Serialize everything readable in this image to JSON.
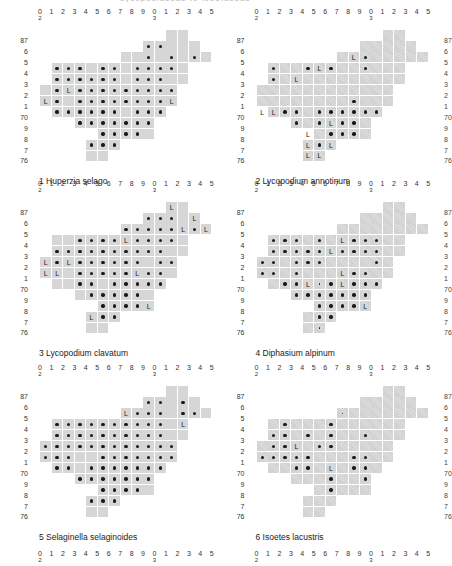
{
  "page": {
    "top_cut_text": "Lycopodiaceae to Isoetaceae"
  },
  "axis": {
    "x_labels": [
      "0",
      "1",
      "2",
      "3",
      "4",
      "5",
      "6",
      "7",
      "8",
      "9",
      "0",
      "1",
      "2",
      "3",
      "4",
      "5"
    ],
    "x_sub_labels": {
      "0": "2",
      "10": "3"
    },
    "y_labels": [
      "87",
      "6",
      "5",
      "4",
      "3",
      "2",
      "1",
      "70",
      "9",
      "8",
      "7",
      "76"
    ]
  },
  "shared_shape": {
    "note": "shaded 10km grid squares per row, columns by x index",
    "rows": {
      "87": [
        12,
        13
      ],
      "6": [
        10,
        11,
        12,
        13,
        14
      ],
      "5": [
        8,
        9,
        10,
        11,
        12,
        13,
        14,
        15
      ],
      "4": [
        2,
        3,
        4,
        5,
        6,
        7,
        8,
        9,
        10,
        11,
        12,
        13
      ],
      "3": [
        2,
        3,
        4,
        5,
        6,
        7,
        8,
        9,
        10,
        11,
        12,
        13
      ],
      "2": [
        1,
        2,
        3,
        4,
        5,
        6,
        7,
        8,
        9,
        10,
        11,
        12
      ],
      "1": [
        1,
        2,
        3,
        4,
        5,
        6,
        7,
        8,
        9,
        10,
        11,
        12
      ],
      "70": [
        2,
        3,
        4,
        5,
        6,
        7,
        8,
        9,
        10,
        11
      ],
      "9": [
        4,
        5,
        6,
        7,
        8,
        9,
        10
      ],
      "8": [
        6,
        7,
        8,
        9,
        10
      ],
      "7": [
        5,
        6,
        7
      ],
      "76": [
        5,
        6
      ]
    }
  },
  "maps": [
    {
      "number": "1",
      "species": "Huperzia selago",
      "caption": "1  Huperzia selago",
      "style": "plain",
      "dots": {
        "6": [
          10,
          11
        ],
        "5": [
          10,
          12,
          14
        ],
        "4": [
          2,
          3,
          4,
          6,
          7,
          9,
          10,
          11,
          12
        ],
        "3": [
          2,
          3,
          4,
          5,
          6,
          7,
          9,
          10,
          11
        ],
        "2": [
          2,
          4,
          5,
          6,
          7,
          8,
          9,
          10,
          11,
          12
        ],
        "1": [
          2,
          4,
          5,
          6,
          7,
          8,
          9,
          10,
          11
        ],
        "70": [
          2,
          3,
          4,
          5,
          6,
          7,
          9,
          10,
          11
        ],
        "9": [
          4,
          5,
          6,
          7,
          8,
          9,
          10
        ],
        "8": [
          6,
          7,
          8,
          9
        ],
        "7": [
          5,
          6,
          7
        ]
      },
      "L": {
        "2": [
          3
        ],
        "1": [
          1,
          12
        ]
      },
      "tiny": {}
    },
    {
      "number": "2",
      "species": "Lycopodium annotinum",
      "caption": "2  Lycopodium annotinum",
      "style": "hatched",
      "dots": {
        "5": [
          10
        ],
        "4": [
          2,
          5,
          7,
          10
        ],
        "3": [
          2
        ],
        "1": [
          9
        ],
        "70": [
          3,
          4,
          6,
          7,
          8,
          9,
          10,
          11
        ],
        "9": [
          4,
          6,
          8,
          9
        ],
        "8": [
          7,
          8,
          9
        ],
        "7": [
          6
        ]
      },
      "L": {
        "5": [
          9
        ],
        "4": [
          6
        ],
        "3": [
          4
        ],
        "70": [
          1,
          2
        ],
        "9": [
          7
        ],
        "8": [
          5
        ],
        "7": [
          5,
          7
        ],
        "76": [
          5,
          6
        ]
      },
      "tiny": {}
    },
    {
      "number": "3",
      "species": "Lycopodium clavatum",
      "caption": "3  Lycopodium clavatum",
      "style": "plain",
      "dots": {
        "6": [
          10,
          11,
          12
        ],
        "5": [
          8,
          9,
          10,
          11,
          12,
          14
        ],
        "4": [
          4,
          5,
          6,
          7,
          9,
          10,
          11,
          12
        ],
        "3": [
          2,
          3,
          4,
          5,
          6,
          7,
          8,
          9,
          10,
          11
        ],
        "2": [
          2,
          4,
          5,
          6,
          7,
          8,
          9,
          11,
          12
        ],
        "1": [
          4,
          5,
          6,
          7,
          8,
          10,
          11
        ],
        "70": [
          4,
          5,
          7,
          8,
          9,
          10,
          11
        ],
        "9": [
          5,
          6,
          7,
          8,
          9
        ],
        "8": [
          6,
          7,
          8,
          9
        ],
        "7": [
          6,
          7
        ]
      },
      "L": {
        "87": [
          12
        ],
        "6": [
          14
        ],
        "5": [
          13,
          15
        ],
        "4": [
          8
        ],
        "2": [
          1,
          3
        ],
        "1": [
          1,
          2,
          9
        ],
        "8": [
          10
        ],
        "7": [
          5
        ]
      },
      "tiny": {}
    },
    {
      "number": "4",
      "species": "Diphasium alpinum",
      "caption": "4  Diphasium alpinum",
      "style": "hatched",
      "dots": {
        "4": [
          2,
          3,
          4,
          6,
          9,
          10,
          11
        ],
        "3": [
          2,
          3,
          4,
          5,
          6,
          8,
          9,
          10,
          11
        ],
        "2": [
          1,
          2,
          4,
          5,
          6,
          11
        ],
        "1": [
          1,
          2,
          4,
          9,
          10
        ],
        "70": [
          3,
          4,
          7,
          9,
          10,
          11
        ],
        "9": [
          4,
          5,
          6,
          7,
          8,
          9,
          10
        ],
        "8": [
          6,
          7,
          8,
          9
        ],
        "7": [
          6,
          7
        ]
      },
      "L": {
        "4": [
          8
        ],
        "3": [
          7
        ],
        "1": [
          8
        ],
        "70": [
          5,
          8
        ],
        "8": [
          10
        ]
      },
      "tiny": {
        "76": [
          6
        ],
        "70": [
          6
        ]
      }
    },
    {
      "number": "5",
      "species": "Selaginella selaginoides",
      "caption": "5  Selaginella selaginoides",
      "style": "plain",
      "dots": {
        "6": [
          10,
          11,
          13
        ],
        "5": [
          9,
          10,
          11,
          13,
          14
        ],
        "4": [
          2,
          3,
          4,
          5,
          6,
          7,
          8,
          9,
          10,
          11
        ],
        "3": [
          2,
          3,
          4,
          5,
          6,
          7,
          8,
          9,
          10,
          11
        ],
        "2": [
          1,
          2,
          3,
          4,
          5,
          6,
          7,
          8,
          9,
          10,
          11,
          12
        ],
        "1": [
          1,
          2,
          3,
          6,
          7,
          8,
          9,
          10,
          11,
          12
        ],
        "70": [
          2,
          3,
          5,
          6,
          7,
          8,
          9,
          10,
          11
        ],
        "9": [
          4,
          5,
          6,
          7,
          8,
          9,
          10
        ],
        "8": [
          6,
          7,
          8,
          9
        ],
        "7": [
          5,
          6,
          7
        ]
      },
      "L": {
        "5": [
          8
        ],
        "4": [
          13
        ]
      },
      "tiny": {}
    },
    {
      "number": "6",
      "species": "Isoetes lacustris",
      "caption": "6  Isoetes lacustris",
      "style": "hatched",
      "dots": {
        "4": [
          3,
          7
        ],
        "3": [
          2,
          3,
          5,
          7,
          10
        ],
        "2": [
          2,
          3,
          6,
          7
        ],
        "1": [
          1,
          2,
          3,
          4,
          5,
          9,
          10
        ],
        "70": [
          4,
          5,
          9,
          10
        ],
        "9": [
          7,
          10
        ],
        "8": [
          7
        ]
      },
      "L": {
        "2": [
          4
        ],
        "70": [
          7
        ]
      },
      "tiny": {
        "5": [
          8
        ]
      }
    }
  ],
  "bottom_axis_labels": [
    "0",
    "1",
    "2",
    "3",
    "4",
    "5",
    "6",
    "7",
    "8",
    "9",
    "0",
    "1",
    "2",
    "3",
    "4",
    "5"
  ],
  "right_edge_cut_labels": {
    "row1": [
      "87",
      "6",
      "5",
      "4",
      "3",
      "2",
      "1",
      "70",
      "9",
      "8",
      "7",
      "76"
    ],
    "row2": [
      "87",
      "6",
      "5",
      "4",
      "3",
      "2",
      "1",
      "70",
      "9",
      "8",
      "7",
      "76"
    ],
    "row3": [
      "87",
      "6",
      "5",
      "4",
      "3",
      "2",
      "1",
      "70",
      "9",
      "8",
      "7",
      "76"
    ]
  }
}
